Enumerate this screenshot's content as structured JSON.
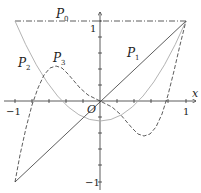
{
  "diagram": {
    "axes": {
      "x_label": "x",
      "origin_label": "O",
      "x_ticks": [
        "-1",
        "1"
      ],
      "y_ticks": [
        "1",
        "-1"
      ]
    },
    "curves": [
      {
        "name": "P0",
        "label": "P",
        "sub": "0",
        "style": "dash-dot",
        "color": "#333333"
      },
      {
        "name": "P1",
        "label": "P",
        "sub": "1",
        "style": "solid",
        "color": "#333333"
      },
      {
        "name": "P2",
        "label": "P",
        "sub": "2",
        "style": "solid",
        "color": "#aaaaaa"
      },
      {
        "name": "P3",
        "label": "P",
        "sub": "3",
        "style": "dashed",
        "color": "#333333"
      }
    ]
  }
}
